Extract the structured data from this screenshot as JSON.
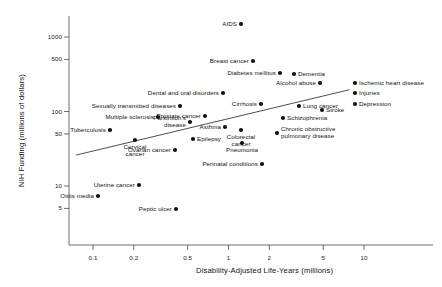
{
  "chart_data": {
    "type": "scatter",
    "title": "",
    "xlabel": "Disability-Adjusted Life-Years (millions)",
    "ylabel": "NIH Funding (millions of dollars)",
    "xscale": "log",
    "yscale": "log",
    "xlim": [
      0.06,
      20
    ],
    "ylim": [
      3.5,
      2000
    ],
    "grid": false,
    "legend": "none",
    "xticks": [
      "0.1",
      "0.2",
      "0.5",
      "1",
      "2",
      "5",
      "10"
    ],
    "xtick_values": [
      0.1,
      0.2,
      0.5,
      1,
      2,
      5,
      10
    ],
    "yticks": [
      "1000",
      "500",
      "100",
      "50",
      "10",
      "5"
    ],
    "ytick_values": [
      1000,
      500,
      100,
      50,
      10,
      5
    ],
    "point_color": "#111111",
    "trendline": {
      "present": true,
      "x_start": 0.075,
      "y_start": 26,
      "x_end": 7.8,
      "y_end": 196
    },
    "points": [
      {
        "label": "AIDS",
        "x": 1.0,
        "y": 1450,
        "lx": 241,
        "ly": 24,
        "align": "right"
      },
      {
        "label": "Breast cancer",
        "x": 1.15,
        "y": 490,
        "lx": 253,
        "ly": 61,
        "align": "right"
      },
      {
        "label": "Diabetes mellitus",
        "x": 1.6,
        "y": 340,
        "lx": 280,
        "ly": 73,
        "align": "right"
      },
      {
        "label": "Dementia",
        "x": 2.0,
        "y": 330,
        "lx": 294,
        "ly": 74,
        "align": "left"
      },
      {
        "label": "Alcohol abuse",
        "x": 2.9,
        "y": 245,
        "lx": 320,
        "ly": 83,
        "align": "right"
      },
      {
        "label": "Ischemic heart disease",
        "x": 8.3,
        "y": 245,
        "lx": 355,
        "ly": 83,
        "align": "left"
      },
      {
        "label": "Injuries",
        "x": 8.3,
        "y": 195,
        "lx": 355,
        "ly": 93,
        "align": "left"
      },
      {
        "label": "Depression",
        "x": 8.3,
        "y": 148,
        "lx": 355,
        "ly": 104,
        "align": "left"
      },
      {
        "label": "Dental and oral disorders",
        "x": 0.82,
        "y": 190,
        "lx": 223,
        "ly": 93,
        "align": "right"
      },
      {
        "label": "Cirrhosis",
        "x": 1.55,
        "y": 148,
        "lx": 261,
        "ly": 104,
        "align": "right"
      },
      {
        "label": "Sexually transmitted diseases",
        "x": 0.41,
        "y": 140,
        "lx": 180,
        "ly": 106,
        "align": "right"
      },
      {
        "label": "Lung cancer",
        "x": 2.2,
        "y": 136,
        "lx": 299,
        "ly": 106,
        "align": "left"
      },
      {
        "label": "Stroke",
        "x": 3.0,
        "y": 118,
        "lx": 322,
        "ly": 110,
        "align": "left"
      },
      {
        "label": "Prostate cancer",
        "x": 0.6,
        "y": 110,
        "lx": 205,
        "ly": 116,
        "align": "right"
      },
      {
        "label": "Multiple sclerosis",
        "x": 0.28,
        "y": 108,
        "lx": 158,
        "ly": 117,
        "align": "right"
      },
      {
        "label": "Schizophrenia",
        "x": 1.9,
        "y": 96,
        "lx": 283,
        "ly": 118,
        "align": "left"
      },
      {
        "label": "Parkinson's\ndisease",
        "x": 0.45,
        "y": 98,
        "lx": 190,
        "ly": 122,
        "align": "right"
      },
      {
        "label": "Asthma",
        "x": 1.1,
        "y": 82,
        "lx": 225,
        "ly": 127,
        "align": "right"
      },
      {
        "label": "Colorectal\ncancer",
        "x": 1.35,
        "y": 78,
        "lx": 241,
        "ly": 130,
        "align": "center"
      },
      {
        "label": "Tuberculosis",
        "x": 0.155,
        "y": 72,
        "lx": 110,
        "ly": 130,
        "align": "right"
      },
      {
        "label": "Chronic obstructive\npulmonary disease",
        "x": 1.75,
        "y": 72,
        "lx": 277,
        "ly": 133,
        "align": "left"
      },
      {
        "label": "Cervical\ncancer",
        "x": 0.215,
        "y": 59,
        "lx": 135,
        "ly": 140,
        "align": "center"
      },
      {
        "label": "Epilepsy",
        "x": 0.46,
        "y": 58,
        "lx": 193,
        "ly": 139,
        "align": "left"
      },
      {
        "label": "Pneumonia",
        "x": 1.37,
        "y": 52,
        "lx": 242,
        "ly": 143,
        "align": "center"
      },
      {
        "label": "Ovarian cancer",
        "x": 0.34,
        "y": 46,
        "lx": 175,
        "ly": 150,
        "align": "right"
      },
      {
        "label": "Perinatal conditions",
        "x": 1.45,
        "y": 33,
        "lx": 262,
        "ly": 164,
        "align": "right"
      },
      {
        "label": "Uterine cancer",
        "x": 0.215,
        "y": 13,
        "lx": 139,
        "ly": 185,
        "align": "right"
      },
      {
        "label": "Otitis media",
        "x": 0.105,
        "y": 9.6,
        "lx": 98,
        "ly": 196,
        "align": "right"
      },
      {
        "label": "Peptic ulcer",
        "x": 0.42,
        "y": 6.8,
        "lx": 176,
        "ly": 209,
        "align": "right"
      }
    ]
  }
}
